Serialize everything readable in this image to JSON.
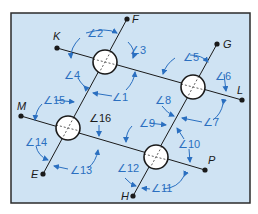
{
  "diagram": {
    "background_color": "#cfe3f3",
    "frame_color": "#2b2b2b",
    "line_color": "#1a1a1a",
    "arc_color": "#2a6fc0",
    "points": [
      {
        "id": "K",
        "label": "K",
        "x": 57,
        "y": 48
      },
      {
        "id": "L",
        "label": "L",
        "x": 242,
        "y": 100
      },
      {
        "id": "M",
        "label": "M",
        "x": 21,
        "y": 116
      },
      {
        "id": "P",
        "label": "P",
        "x": 205,
        "y": 170
      },
      {
        "id": "F",
        "label": "F",
        "x": 127,
        "y": 19
      },
      {
        "id": "E",
        "label": "E",
        "x": 43,
        "y": 174
      },
      {
        "id": "G",
        "label": "G",
        "x": 217,
        "y": 44
      },
      {
        "id": "H",
        "label": "H",
        "x": 133,
        "y": 196
      }
    ],
    "intersections": [
      {
        "id": "c1",
        "x": 105,
        "y": 62
      },
      {
        "id": "c2",
        "x": 193,
        "y": 87
      },
      {
        "id": "c3",
        "x": 68,
        "y": 128
      },
      {
        "id": "c4",
        "x": 156,
        "y": 157
      }
    ],
    "angles": [
      {
        "label": "∠1",
        "x": 100,
        "y": 97
      },
      {
        "label": "∠2",
        "x": 87,
        "y": 37
      },
      {
        "label": "∠3",
        "x": 130,
        "y": 54
      },
      {
        "label": "∠4",
        "x": 64,
        "y": 79
      },
      {
        "label": "∠5",
        "x": 183,
        "y": 59
      },
      {
        "label": "∠6",
        "x": 215,
        "y": 80
      },
      {
        "label": "∠7",
        "x": 208,
        "y": 124
      },
      {
        "label": "∠8",
        "x": 155,
        "y": 104
      },
      {
        "label": "∠9",
        "x": 139,
        "y": 126
      },
      {
        "label": "∠10",
        "x": 178,
        "y": 148
      },
      {
        "label": "∠11",
        "x": 154,
        "y": 192
      },
      {
        "label": "∠12",
        "x": 118,
        "y": 171
      },
      {
        "label": "∠13",
        "x": 70,
        "y": 174
      },
      {
        "label": "∠14",
        "x": 28,
        "y": 146
      },
      {
        "label": "∠15",
        "x": 44,
        "y": 104
      },
      {
        "label": "∠16",
        "x": 90,
        "y": 121
      }
    ]
  }
}
